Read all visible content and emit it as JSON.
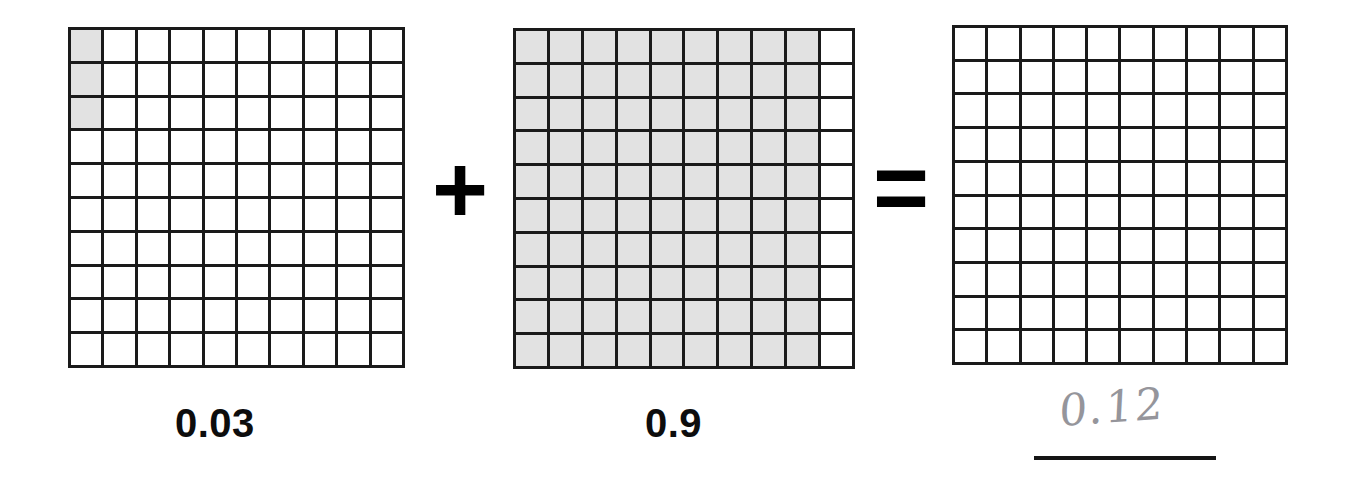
{
  "worksheet": {
    "type": "decimal-grid-addition",
    "grid_rows": 10,
    "grid_columns": 10,
    "total_cells_per_grid": 100,
    "shade_color": "#e2e2e2",
    "line_color": "#1a1a1a"
  },
  "operands": [
    {
      "name": "first-addend",
      "label": "0.03",
      "shaded_cells": 3,
      "shaded_description": "column 1, rows 1-3",
      "shaded_map": [
        [
          1,
          0,
          0,
          0,
          0,
          0,
          0,
          0,
          0,
          0
        ],
        [
          1,
          0,
          0,
          0,
          0,
          0,
          0,
          0,
          0,
          0
        ],
        [
          1,
          0,
          0,
          0,
          0,
          0,
          0,
          0,
          0,
          0
        ],
        [
          0,
          0,
          0,
          0,
          0,
          0,
          0,
          0,
          0,
          0
        ],
        [
          0,
          0,
          0,
          0,
          0,
          0,
          0,
          0,
          0,
          0
        ],
        [
          0,
          0,
          0,
          0,
          0,
          0,
          0,
          0,
          0,
          0
        ],
        [
          0,
          0,
          0,
          0,
          0,
          0,
          0,
          0,
          0,
          0
        ],
        [
          0,
          0,
          0,
          0,
          0,
          0,
          0,
          0,
          0,
          0
        ],
        [
          0,
          0,
          0,
          0,
          0,
          0,
          0,
          0,
          0,
          0
        ],
        [
          0,
          0,
          0,
          0,
          0,
          0,
          0,
          0,
          0,
          0
        ]
      ]
    },
    {
      "name": "second-addend",
      "label": "0.9",
      "shaded_cells": 90,
      "shaded_description": "columns 1-9, all rows",
      "shaded_map": [
        [
          1,
          1,
          1,
          1,
          1,
          1,
          1,
          1,
          1,
          0
        ],
        [
          1,
          1,
          1,
          1,
          1,
          1,
          1,
          1,
          1,
          0
        ],
        [
          1,
          1,
          1,
          1,
          1,
          1,
          1,
          1,
          1,
          0
        ],
        [
          1,
          1,
          1,
          1,
          1,
          1,
          1,
          1,
          1,
          0
        ],
        [
          1,
          1,
          1,
          1,
          1,
          1,
          1,
          1,
          1,
          0
        ],
        [
          1,
          1,
          1,
          1,
          1,
          1,
          1,
          1,
          1,
          0
        ],
        [
          1,
          1,
          1,
          1,
          1,
          1,
          1,
          1,
          1,
          0
        ],
        [
          1,
          1,
          1,
          1,
          1,
          1,
          1,
          1,
          1,
          0
        ],
        [
          1,
          1,
          1,
          1,
          1,
          1,
          1,
          1,
          1,
          0
        ],
        [
          1,
          1,
          1,
          1,
          1,
          1,
          1,
          1,
          1,
          0
        ]
      ]
    },
    {
      "name": "sum-grid",
      "label": "",
      "shaded_cells": 0,
      "shaded_description": "empty - not shaded by student",
      "shaded_map": [
        [
          0,
          0,
          0,
          0,
          0,
          0,
          0,
          0,
          0,
          0
        ],
        [
          0,
          0,
          0,
          0,
          0,
          0,
          0,
          0,
          0,
          0
        ],
        [
          0,
          0,
          0,
          0,
          0,
          0,
          0,
          0,
          0,
          0
        ],
        [
          0,
          0,
          0,
          0,
          0,
          0,
          0,
          0,
          0,
          0
        ],
        [
          0,
          0,
          0,
          0,
          0,
          0,
          0,
          0,
          0,
          0
        ],
        [
          0,
          0,
          0,
          0,
          0,
          0,
          0,
          0,
          0,
          0
        ],
        [
          0,
          0,
          0,
          0,
          0,
          0,
          0,
          0,
          0,
          0
        ],
        [
          0,
          0,
          0,
          0,
          0,
          0,
          0,
          0,
          0,
          0
        ],
        [
          0,
          0,
          0,
          0,
          0,
          0,
          0,
          0,
          0,
          0
        ],
        [
          0,
          0,
          0,
          0,
          0,
          0,
          0,
          0,
          0,
          0
        ]
      ]
    }
  ],
  "operators": {
    "plus": "+",
    "equals": "="
  },
  "answer": {
    "handwritten_value": "0.12",
    "has_answer_line": true
  }
}
